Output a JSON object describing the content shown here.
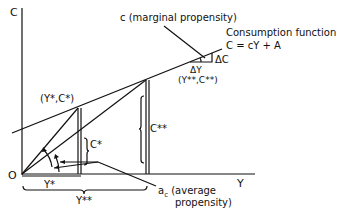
{
  "diagram": {
    "axes": {
      "y_label": "C",
      "x_label": "Y",
      "origin_label": "O"
    },
    "points": {
      "point_star": "(Y*,C*)",
      "point_double_star": "(Y**,C**)"
    },
    "measures": {
      "c_star": "C*",
      "c_double_star": "C**",
      "y_star": "Y*",
      "y_double_star": "Y**",
      "delta_y": "ΔY",
      "delta_c": "ΔC"
    },
    "annotations": {
      "marginal_propensity": "c (marginal propensity)",
      "consumption_function_title": "Consumption function",
      "consumption_function_equation": "C = cY + A",
      "average_propensity_line1": "a",
      "average_propensity_sub": "c",
      "average_propensity_line1_rest": " (average",
      "average_propensity_line2": "propensity)"
    },
    "colors": {
      "ink": "#111111",
      "background": "#ffffff"
    }
  }
}
